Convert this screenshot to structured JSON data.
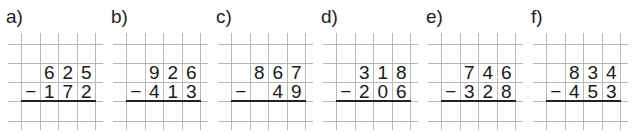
{
  "exercises": [
    {
      "label": "a)",
      "minuend": [
        "6",
        "2",
        "5"
      ],
      "operator": "−",
      "subtrahend": [
        "1",
        "7",
        "2"
      ]
    },
    {
      "label": "b)",
      "minuend": [
        "9",
        "2",
        "6"
      ],
      "operator": "−",
      "subtrahend": [
        "4",
        "1",
        "3"
      ]
    },
    {
      "label": "c)",
      "minuend": [
        "8",
        "6",
        "7"
      ],
      "operator": "−",
      "subtrahend": [
        "",
        "4",
        "9"
      ]
    },
    {
      "label": "d)",
      "minuend": [
        "3",
        "1",
        "8"
      ],
      "operator": "−",
      "subtrahend": [
        "2",
        "0",
        "6"
      ]
    },
    {
      "label": "e)",
      "minuend": [
        "7",
        "4",
        "6"
      ],
      "operator": "−",
      "subtrahend": [
        "3",
        "2",
        "8"
      ]
    },
    {
      "label": "f)",
      "minuend": [
        "8",
        "3",
        "4"
      ],
      "operator": "−",
      "subtrahend": [
        "4",
        "5",
        "3"
      ]
    }
  ],
  "colors": {
    "grid": "#b8b8b8",
    "text": "#1a1a1a",
    "result_line": "#222222"
  }
}
